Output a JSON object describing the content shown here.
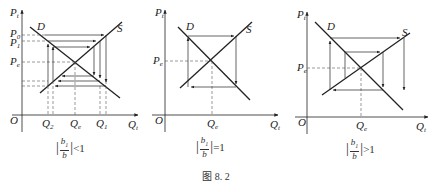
{
  "figure": {
    "caption": "图 8. 2",
    "panels": [
      {
        "id": "panel-1",
        "y_axis_label": "P",
        "y_axis_sub": "t",
        "x_axis_label": "Q",
        "x_axis_sub": "t",
        "origin_label": "O",
        "demand_label": "D",
        "supply_label": "S",
        "price_labels": [
          {
            "main": "P",
            "sub": "0"
          },
          {
            "main": "P",
            "sub": "1"
          },
          {
            "main": "P",
            "sub": "e"
          }
        ],
        "quantity_labels": [
          {
            "main": "Q",
            "sub": "2"
          },
          {
            "main": "Q",
            "sub": "e"
          },
          {
            "main": "Q",
            "sub": "1"
          }
        ],
        "condition": {
          "num": "b",
          "num_sub": "1",
          "den": "b",
          "relation": "<1"
        },
        "behavior": "converging cobweb"
      },
      {
        "id": "panel-2",
        "y_axis_label": "P",
        "y_axis_sub": "t",
        "x_axis_label": "Q",
        "x_axis_sub": "t",
        "origin_label": "O",
        "demand_label": "D",
        "supply_label": "S",
        "price_labels": [
          {
            "main": "P",
            "sub": "e"
          }
        ],
        "quantity_labels": [
          {
            "main": "Q",
            "sub": "e"
          }
        ],
        "condition": {
          "num": "b",
          "num_sub": "1",
          "den": "b",
          "relation": "=1"
        },
        "behavior": "closed cycle cobweb"
      },
      {
        "id": "panel-3",
        "y_axis_label": "P",
        "y_axis_sub": "t",
        "x_axis_label": "Q",
        "x_axis_sub": "t",
        "origin_label": "O",
        "demand_label": "D",
        "supply_label": "S",
        "price_labels": [
          {
            "main": "P",
            "sub": "e"
          }
        ],
        "quantity_labels": [
          {
            "main": "Q",
            "sub": "e"
          }
        ],
        "condition": {
          "num": "b",
          "num_sub": "1",
          "den": "b",
          "relation": ">1"
        },
        "behavior": "diverging cobweb"
      }
    ]
  },
  "colors": {
    "line": "#222222",
    "guide": "#555555"
  }
}
